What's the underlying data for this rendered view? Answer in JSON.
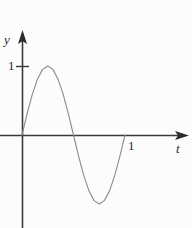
{
  "figure": {
    "background_color": "#fcfcfc",
    "width": 192,
    "height": 228
  },
  "axes": {
    "y_axis": {
      "label": "y",
      "color": "#3a3a3a",
      "arrow": "up-arrow-icon",
      "x_pos": 22,
      "top": 31,
      "bottom": 228
    },
    "x_axis": {
      "label": "t",
      "color": "#3a3a3a",
      "arrow": "right-arrow-icon",
      "y_pos": 135,
      "left": 0,
      "right": 188
    }
  },
  "ticks": {
    "y": [
      {
        "label": "1",
        "value": 1,
        "pixel_y": 66
      }
    ],
    "x": [
      {
        "label": "1",
        "value": 1,
        "pixel_x": 125
      }
    ]
  },
  "curve": {
    "color": "#8a8a8a",
    "stroke_width": 1,
    "path": "M 22 135 C 31 100, 40 66, 52 66 C 64 66, 70 105, 75 135 C 80 168, 89 205, 100 205 C 111 205, 118 168, 125 135 C 125 135, 125 135, 125 135"
  },
  "chart_data": {
    "type": "line",
    "title": "",
    "xlabel": "t",
    "ylabel": "y",
    "grid": false,
    "legend": null,
    "xlim": [
      -0.05,
      1.6
    ],
    "ylim": [
      -1.35,
      1.45
    ],
    "xticks": [
      1
    ],
    "xticklabels": [
      "1"
    ],
    "yticks": [
      1
    ],
    "yticklabels": [
      "1"
    ],
    "series": [
      {
        "name": "sin(2*pi*t)",
        "x": [
          0.0,
          0.05,
          0.1,
          0.15,
          0.2,
          0.25,
          0.3,
          0.35,
          0.4,
          0.45,
          0.5,
          0.55,
          0.6,
          0.65,
          0.7,
          0.75,
          0.8,
          0.85,
          0.9,
          0.95,
          1.0
        ],
        "y": [
          0.0,
          0.309,
          0.588,
          0.809,
          0.951,
          1.0,
          0.951,
          0.809,
          0.588,
          0.309,
          0.0,
          -0.309,
          -0.588,
          -0.809,
          -0.951,
          -1.0,
          -0.951,
          -0.809,
          -0.588,
          -0.309,
          0.0
        ]
      }
    ],
    "annotations": []
  }
}
